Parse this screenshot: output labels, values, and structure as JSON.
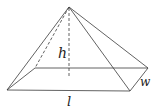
{
  "diagram": {
    "type": "rectangular pyramid",
    "labels": {
      "height": "h",
      "width": "w",
      "length": "l"
    },
    "colors": {
      "stroke": "#3a3a3a",
      "text": "#222222",
      "background": "#ffffff"
    }
  }
}
